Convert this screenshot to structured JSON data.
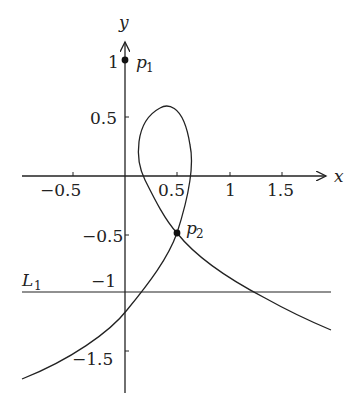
{
  "axes": {
    "x_label": "x",
    "y_label": "y",
    "x_ticks": [
      {
        "value": -0.5,
        "label": "−0.5"
      },
      {
        "value": 0.5,
        "label": "0.5"
      },
      {
        "value": 1,
        "label": "1"
      },
      {
        "value": 1.5,
        "label": "1.5"
      }
    ],
    "y_ticks": [
      {
        "value": 1,
        "label": "1"
      },
      {
        "value": 0.5,
        "label": "0.5"
      },
      {
        "value": -0.5,
        "label": "−0.5"
      },
      {
        "value": -1,
        "label": "−1"
      },
      {
        "value": -1.5,
        "label": "−1.5"
      }
    ]
  },
  "points": [
    {
      "name": "p1",
      "label": "p",
      "sub": "1",
      "x": 0,
      "y": 1
    },
    {
      "name": "p2",
      "label": "p",
      "sub": "2",
      "x": 0.5,
      "y": -0.5
    }
  ],
  "line": {
    "name": "L1",
    "label": "L",
    "sub": "1",
    "y": -1
  },
  "curve": {
    "description": "Self-intersecting curve with a loop above the x-axis, crossing itself at p2"
  }
}
